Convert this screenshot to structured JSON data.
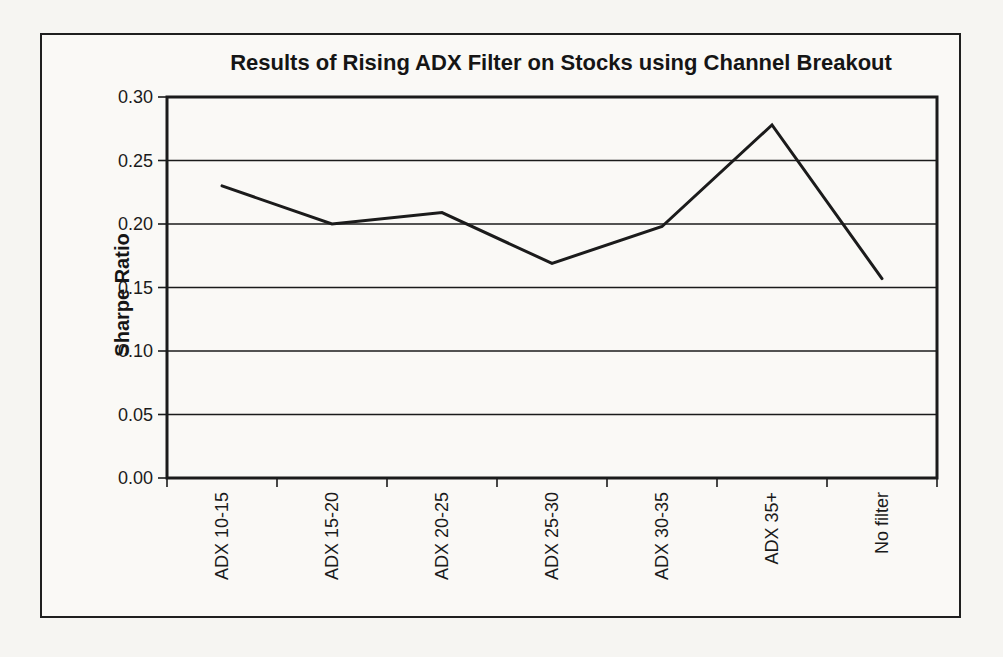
{
  "figure": {
    "title": "Results of Rising ADX Filter on Stocks using Channel Breakout"
  },
  "chart_data": {
    "type": "line",
    "title": "Results of Rising ADX Filter on Stocks using Channel Breakout",
    "xlabel": "",
    "ylabel": "Sharpe Ratio",
    "categories": [
      "ADX 10-15",
      "ADX 15-20",
      "ADX 20-25",
      "ADX 25-30",
      "ADX 30-35",
      "ADX 35+",
      "No filter"
    ],
    "series": [
      {
        "name": "Sharpe Ratio",
        "values": [
          0.23,
          0.2,
          0.209,
          0.169,
          0.198,
          0.278,
          0.157
        ]
      }
    ],
    "ylim": [
      0.0,
      0.3
    ],
    "y_tick_step": 0.05,
    "y_tick_labels": [
      "0.00",
      "0.05",
      "0.10",
      "0.15",
      "0.20",
      "0.25",
      "0.30"
    ],
    "grid": true,
    "legend_position": "none",
    "line_color": "#1b1b1b",
    "ink_color": "#1b1b1b",
    "line_width": 3
  }
}
